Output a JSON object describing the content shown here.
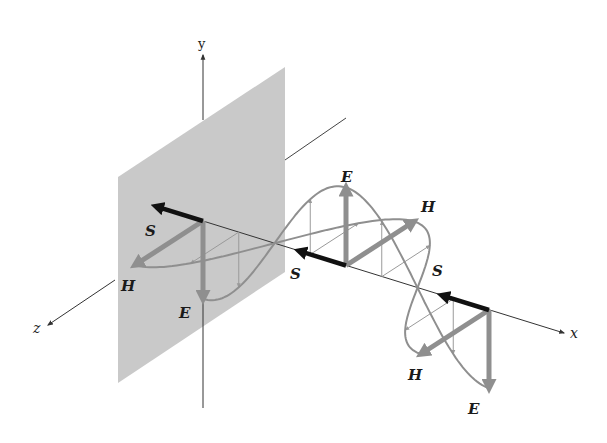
{
  "figure": {
    "title": "",
    "colors": {
      "background": "#ffffff",
      "plane": "#c8c8c8",
      "axis": "#333333",
      "field": "#8f8f8f",
      "field_thin": "#9a9a9a",
      "poynting": "#111111",
      "label": "#1a1a1a"
    }
  },
  "axes": {
    "x_label": "x",
    "y_label": "y",
    "z_label": "z"
  },
  "labels": {
    "E_left": "E",
    "H_left": "H",
    "S_left": "S",
    "E_mid": "E",
    "H_mid": "H",
    "S_mid": "S",
    "S_right": "S",
    "H_right": "H",
    "E_right": "E"
  },
  "wave": {
    "origin_px": [
      203,
      221
    ],
    "half_wavelength_px": [
      143,
      44.5
    ],
    "E_amplitude_px": 78,
    "H_amplitude_px": [
      -68,
      44
    ],
    "half_wavelengths": 2,
    "vector_samples_per_half": 4
  }
}
